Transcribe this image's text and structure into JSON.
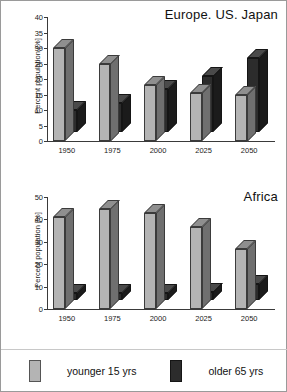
{
  "figure": {
    "background_color": "#ffffff",
    "border_color": "#9a9a9a"
  },
  "legend": {
    "items": [
      {
        "label": "younger 15 yrs",
        "color": "#b4b4b4",
        "key": "younger"
      },
      {
        "label": "older 65 yrs",
        "color": "#2c2c2c",
        "key": "older"
      }
    ]
  },
  "chart_data": [
    {
      "id": "europe-us-japan",
      "type": "bar",
      "title": "Europe. US. Japan",
      "xlabel": "",
      "ylabel": "Percent population [%]",
      "categories": [
        "1950",
        "1975",
        "2000",
        "2025",
        "2050"
      ],
      "ylim": [
        0,
        40
      ],
      "yticks": [
        0,
        5,
        10,
        15,
        20,
        25,
        30,
        35,
        40
      ],
      "grid": false,
      "legend_position": "bottom-outside",
      "series": [
        {
          "name": "younger 15 yrs",
          "color": "#b4b4b4",
          "values": [
            30,
            25,
            18,
            15.5,
            15
          ]
        },
        {
          "name": "older 65 yrs",
          "color": "#2c2c2c",
          "values": [
            7,
            9.5,
            14,
            18,
            24
          ]
        }
      ]
    },
    {
      "id": "africa",
      "type": "bar",
      "title": "Africa",
      "xlabel": "",
      "ylabel": "Percent population [%]",
      "categories": [
        "1950",
        "1975",
        "2000",
        "2025",
        "2050"
      ],
      "ylim": [
        0,
        50
      ],
      "yticks": [
        0,
        10,
        20,
        30,
        40,
        50
      ],
      "grid": false,
      "legend_position": "bottom-outside",
      "series": [
        {
          "name": "younger 15 yrs",
          "color": "#b4b4b4",
          "values": [
            41,
            44.5,
            43,
            36.5,
            27
          ]
        },
        {
          "name": "older 65 yrs",
          "color": "#2c2c2c",
          "values": [
            3,
            3,
            3,
            3.5,
            7
          ]
        }
      ]
    }
  ]
}
